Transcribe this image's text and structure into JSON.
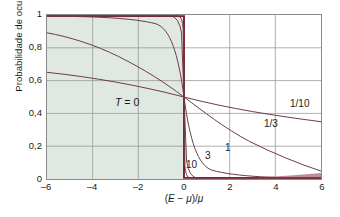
{
  "chart_data": {
    "type": "line",
    "title": "",
    "xlabel": "(E − μ)/μ",
    "ylabel": "Probabilidade de ocupação, P",
    "xlim": [
      -6,
      6
    ],
    "ylim": [
      0,
      1
    ],
    "xticks": [
      "–6",
      "–4",
      "–2",
      "0",
      "2",
      "4",
      "6"
    ],
    "xtick_values": [
      -6,
      -4,
      -2,
      0,
      2,
      4,
      6
    ],
    "yticks": [
      "0",
      "0,2",
      "0,4",
      "0,6",
      "0,8",
      "1"
    ],
    "ytick_values": [
      0,
      0.2,
      0.4,
      0.6,
      0.8,
      1
    ],
    "grid": true,
    "grid_color": "#9a9a9a",
    "curve_color": "#6e3a44",
    "step_color": "#7b2030",
    "shade_color": "#dfe8e1",
    "legend_position": "inline-annotations",
    "annotations": [
      {
        "text": "T = 0",
        "x": -2.6,
        "y": 0.295,
        "italic_first": true
      },
      {
        "text": "10",
        "x": 0.18,
        "y": 0.055
      },
      {
        "text": "3",
        "x": 0.78,
        "y": 0.105
      },
      {
        "text": "1",
        "x": 1.72,
        "y": 0.155
      },
      {
        "text": "1/3",
        "x": 3.45,
        "y": 0.3
      },
      {
        "text": "1/10",
        "x": 4.6,
        "y": 0.415
      }
    ],
    "series": [
      {
        "name": "T = 0",
        "kind": "step",
        "note": "Heaviside step: P=1 for x<0, P=0 for x>0; shaded region under step"
      },
      {
        "name": "10",
        "kT": 0.0455,
        "kind": "fermi"
      },
      {
        "name": "3",
        "kT": 0.1333,
        "kind": "fermi"
      },
      {
        "name": "1",
        "kT": 0.4,
        "kind": "fermi"
      },
      {
        "name": "1/3",
        "kT": 1.3,
        "kind": "fermi"
      },
      {
        "name": "1/10",
        "kT": 4.1,
        "kind": "fermi"
      }
    ],
    "sampled_points": {
      "x": [
        -6,
        -5,
        -4,
        -3,
        -2,
        -1,
        0,
        1,
        2,
        3,
        4,
        5,
        6
      ],
      "1/10": [
        0.651,
        0.632,
        0.613,
        0.593,
        0.573,
        0.552,
        0.5,
        0.489,
        0.468,
        0.448,
        0.427,
        0.407,
        0.387
      ],
      "1/3": [
        0.989,
        0.978,
        0.956,
        0.909,
        0.823,
        0.681,
        0.5,
        0.319,
        0.177,
        0.091,
        0.044,
        0.021,
        0.011
      ],
      "1": [
        1.0,
        1.0,
        1.0,
        0.999,
        0.993,
        0.924,
        0.5,
        0.076,
        0.007,
        0.001,
        0.0,
        0.0,
        0.0
      ],
      "3": [
        1.0,
        1.0,
        1.0,
        1.0,
        1.0,
        1.0,
        0.5,
        0.0,
        0.0,
        0.0,
        0.0,
        0.0,
        0.0
      ],
      "10": [
        1.0,
        1.0,
        1.0,
        1.0,
        1.0,
        1.0,
        0.5,
        0.0,
        0.0,
        0.0,
        0.0,
        0.0,
        0.0
      ]
    }
  }
}
